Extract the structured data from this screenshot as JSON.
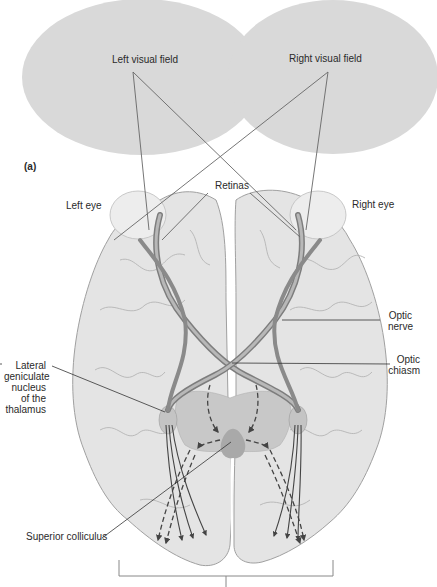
{
  "figure": {
    "panel_label": "(a)",
    "visual_fields": {
      "left": "Left visual field",
      "right": "Right visual field"
    },
    "labels": {
      "retinas": "Retinas",
      "left_eye": "Left eye",
      "right_eye": "Right eye",
      "optic_nerve": [
        "Optic",
        "nerve"
      ],
      "optic_chiasm": [
        "Optic",
        "chiasm"
      ],
      "lgn": [
        "Lateral",
        "geniculate",
        "nucleus",
        "of the",
        "thalamus"
      ],
      "superior_colliculus": "Superior colliculus"
    },
    "colors": {
      "field_fill": "#d9d9d9",
      "brain_fill": "#e4e4e4",
      "brain_outline": "#9a9a9a",
      "thalamus_fill": "#c8c8c8",
      "colliculus_fill": "#a9a9a9",
      "line": "#555555",
      "pathway": "#444444"
    }
  }
}
